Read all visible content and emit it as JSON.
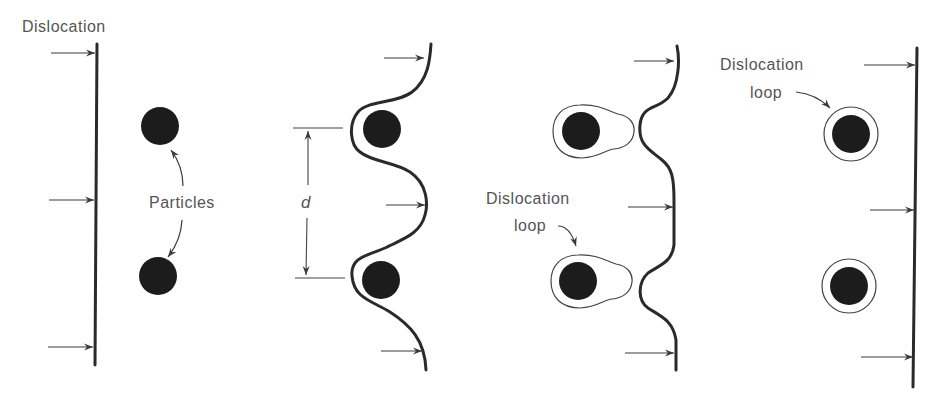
{
  "figure": {
    "panels": [
      {
        "id": "panel-1",
        "label": "Dislocation",
        "annotation": "Particles",
        "description": "Straight dislocation line approaching two particles"
      },
      {
        "id": "panel-2",
        "dimension_label": "d",
        "description": "Dislocation bowing between particles separated by spacing d"
      },
      {
        "id": "panel-3",
        "annotation_line1": "Dislocation",
        "annotation_line2": "loop",
        "description": "Dislocation bypasses particles leaving loops that are pinching off"
      },
      {
        "id": "panel-4",
        "annotation_line1": "Dislocation",
        "annotation_line2": "loop",
        "description": "Straight dislocation continues leaving circular loops around particles"
      }
    ],
    "colors": {
      "line": "#2a2a2a",
      "particle": "#1c1c1c",
      "text": "#555555",
      "background": "#ffffff"
    }
  }
}
